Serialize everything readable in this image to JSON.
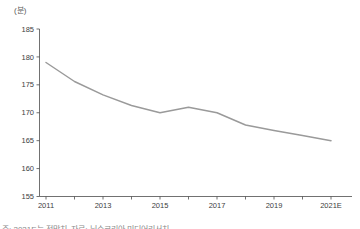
{
  "chart_data": {
    "type": "line",
    "title": "",
    "unit": "(분)",
    "x": [
      "2011",
      "2012",
      "2013",
      "2014",
      "2015",
      "2016",
      "2017",
      "2018",
      "2019",
      "2020",
      "2021E"
    ],
    "values": [
      179,
      175.6,
      173.2,
      171.3,
      170,
      171,
      170,
      167.8,
      166.8,
      165.9,
      165
    ],
    "x_tick_labels": [
      "2011",
      "2013",
      "2015",
      "2017",
      "2019",
      "2021E"
    ],
    "x_tick_label_indices": [
      0,
      2,
      4,
      6,
      8,
      10
    ],
    "y_ticks": [
      155,
      160,
      165,
      170,
      175,
      180,
      185
    ],
    "ylim": [
      155,
      185
    ],
    "grid": false,
    "legend": "none",
    "line_color": "#9a9a9a",
    "axis_color": "#4d4d4d",
    "label_color": "#404040"
  },
  "footnote": "주: 2021E는 전망치, 자료: 닐슨코리아 미디어리서치"
}
